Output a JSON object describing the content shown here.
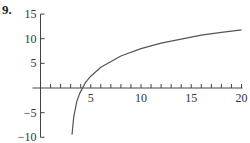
{
  "problem_number": "9.",
  "chart_data": {
    "type": "line",
    "title": "",
    "xlabel": "",
    "ylabel": "",
    "xlim": [
      0,
      20
    ],
    "ylim": [
      -10,
      15
    ],
    "x_ticks_labeled": [
      5,
      10,
      15,
      20
    ],
    "x_minor_tick_step": 1,
    "y_ticks_labeled": [
      -10,
      -5,
      5,
      10,
      15
    ],
    "grid": false,
    "legend": null,
    "series": [
      {
        "name": "curve",
        "x": [
          3.13,
          3.3,
          3.6,
          3.9,
          4.5,
          5,
          6,
          8,
          10,
          12,
          14,
          16,
          18,
          20
        ],
        "y": [
          -9.5,
          -5.9,
          -2.8,
          -1.1,
          1.2,
          2.4,
          4.2,
          6.5,
          8.0,
          9.1,
          9.9,
          10.7,
          11.3,
          11.8
        ]
      }
    ],
    "color": "#555555"
  }
}
